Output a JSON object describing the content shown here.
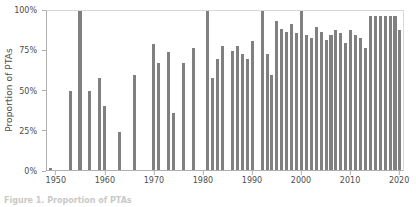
{
  "chart_data": {
    "type": "bar",
    "title": "",
    "xlabel": "",
    "ylabel": "Proportion of PTAs",
    "ylim": [
      0,
      100
    ],
    "xlim": [
      1948,
      2021
    ],
    "grid": false,
    "legend": "none",
    "bar_color": "#808080",
    "axis_color": "#b0b0b0",
    "y_tick_labels": [
      "100%",
      "75%",
      "50%",
      "25%",
      "0%"
    ],
    "y_tick_values": [
      100,
      75,
      50,
      25,
      0
    ],
    "x_tick_labels": [
      "1950",
      "1960",
      "1970",
      "1980",
      "1990",
      "2000",
      "2010",
      "2020"
    ],
    "x_tick_values": [
      1950,
      1960,
      1970,
      1980,
      1990,
      2000,
      2010,
      2020
    ],
    "categories": [
      1949,
      1950,
      1951,
      1952,
      1953,
      1954,
      1955,
      1956,
      1957,
      1958,
      1959,
      1960,
      1961,
      1962,
      1963,
      1964,
      1965,
      1966,
      1967,
      1968,
      1969,
      1970,
      1971,
      1972,
      1973,
      1974,
      1975,
      1976,
      1977,
      1978,
      1979,
      1980,
      1981,
      1982,
      1983,
      1984,
      1985,
      1986,
      1987,
      1988,
      1989,
      1990,
      1991,
      1992,
      1993,
      1994,
      1995,
      1996,
      1997,
      1998,
      1999,
      2000,
      2001,
      2002,
      2003,
      2004,
      2005,
      2006,
      2007,
      2008,
      2009,
      2010,
      2011,
      2012,
      2013,
      2014,
      2015,
      2016,
      2017,
      2018,
      2019,
      2020
    ],
    "values": [
      1,
      0,
      0,
      0,
      50,
      0,
      100,
      0,
      50,
      0,
      58,
      40,
      0,
      0,
      24,
      0,
      0,
      60,
      0,
      0,
      0,
      79,
      67,
      0,
      74,
      36,
      0,
      67,
      0,
      77,
      0,
      0,
      100,
      58,
      70,
      78,
      0,
      75,
      78,
      73,
      70,
      81,
      0,
      100,
      73,
      60,
      94,
      89,
      87,
      92,
      86,
      100,
      85,
      83,
      90,
      87,
      82,
      85,
      88,
      86,
      80,
      88,
      85,
      83,
      77,
      97,
      97,
      97,
      97,
      97,
      97,
      88
    ]
  },
  "axis": {
    "ylabel_text": "Proportion of PTAs"
  },
  "caption": {
    "text": "Figure 1. Proportion of PTAs"
  }
}
